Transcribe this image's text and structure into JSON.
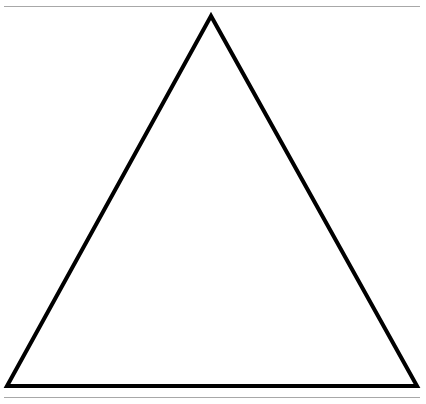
{
  "diagram": {
    "shape": "triangle",
    "kind": "equilateral-outline",
    "stroke_color": "#000000",
    "fill_color": "#ffffff",
    "rule_color": "#a8a8a8",
    "vertices": [
      [
        211,
        16
      ],
      [
        7,
        386
      ],
      [
        417,
        386
      ]
    ]
  }
}
